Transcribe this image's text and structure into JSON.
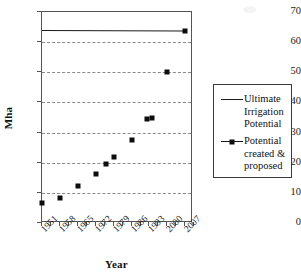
{
  "chart_data": {
    "type": "scatter",
    "title": "",
    "xlabel": "Year",
    "ylabel": "Mha",
    "xlim": [
      1951,
      2010
    ],
    "ylim": [
      0,
      70
    ],
    "grid": true,
    "legend_position": "right",
    "ytick_labels": [
      "0",
      "10",
      "20",
      "30",
      "40",
      "50",
      "60",
      "70"
    ],
    "ytick_values": [
      0,
      10,
      20,
      30,
      40,
      50,
      60,
      70
    ],
    "xtick_labels": [
      "1951",
      "1958",
      "1965",
      "1972",
      "1979",
      "1986",
      "1993",
      "2000",
      "2007"
    ],
    "xtick_values": [
      1951,
      1958,
      1965,
      1972,
      1979,
      1986,
      1993,
      2000,
      2007
    ],
    "series": [
      {
        "name": "Ultimate Irrigation Potential",
        "style": "line",
        "x": [
          1951,
          2007
        ],
        "values": [
          64.0,
          63.8
        ]
      },
      {
        "name": "Potential created & proposed",
        "style": "markers",
        "x": [
          1951,
          1958,
          1965,
          1972,
          1976,
          1979,
          1986,
          1992,
          1994,
          2000,
          2007
        ],
        "values": [
          6.5,
          8.2,
          12.3,
          16.2,
          19.5,
          21.8,
          27.6,
          34.5,
          35.0,
          50.0,
          63.8
        ]
      }
    ]
  },
  "axes": {
    "ylabel": "Mha",
    "xlabel": "Year"
  },
  "legend": {
    "entries": [
      {
        "label_line1": "Ultimate",
        "label_line2": "Irrigation",
        "label_line3": "Potential",
        "label": "Ultimate Irrigation Potential",
        "has_marker": false
      },
      {
        "label_line1": "Potential",
        "label_line2": "created &",
        "label_line3": "proposed",
        "label": "Potential created & proposed",
        "has_marker": true
      }
    ]
  },
  "colors": {
    "series_line": "#1a1a1a",
    "marker": "#0d0d0d",
    "grid": "#8a8a8a",
    "axis": "#555555",
    "background": "#ffffff"
  }
}
